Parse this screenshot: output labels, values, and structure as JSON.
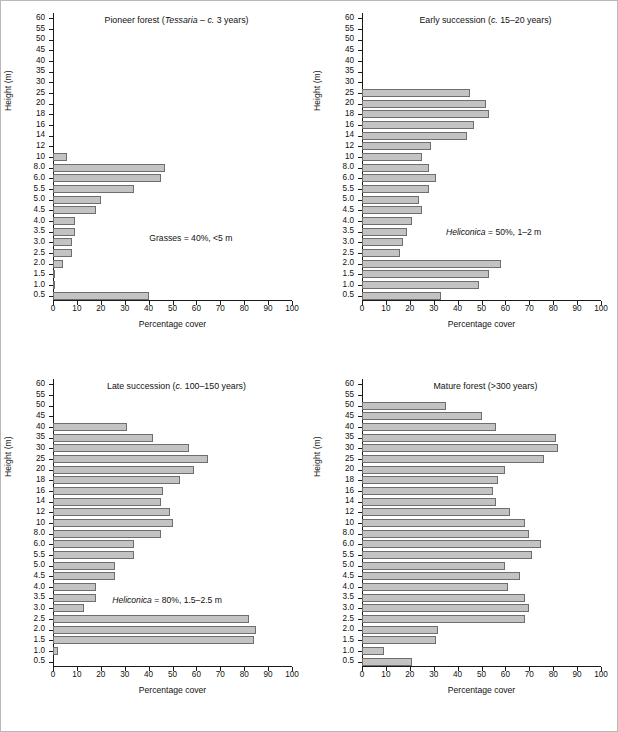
{
  "figure": {
    "name": "vegetation-profile-figure",
    "axis_x_title": "Percentage cover",
    "axis_y_title": "Height (m)",
    "bar_color": "#c3c3c3",
    "bar_edge_color": "#6e6e6e",
    "background": "#ffffff",
    "border_color": "#b9b9b9"
  },
  "axes": {
    "categories": [
      "60",
      "55",
      "50",
      "45",
      "40",
      "35",
      "30",
      "25",
      "20",
      "18",
      "16",
      "14",
      "12",
      "10",
      "8.0",
      "6.0",
      "5.5",
      "5.0",
      "4.5",
      "4.0",
      "3.5",
      "3.0",
      "2.5",
      "2.0",
      "1.5",
      "1.0",
      "0.5"
    ],
    "x_ticks": [
      0,
      10,
      20,
      30,
      40,
      50,
      60,
      70,
      80,
      90,
      100
    ],
    "x_tick_labels": [
      "0",
      "10",
      "20",
      "30",
      "40",
      "50",
      "60",
      "70",
      "80",
      "90",
      "100"
    ],
    "xlim": [
      0,
      100
    ]
  },
  "chart_data": [
    {
      "type": "bar",
      "orientation": "horizontal",
      "panel": "top-left",
      "title": "Pioneer forest (Tessaria – c. 3 years)",
      "title_parts": {
        "lead": "Pioneer forest (",
        "italic": "Tessaria",
        "mid": " – ",
        "italic2": "c.",
        "tail": " 3 years)"
      },
      "annotation": "Grasses = 40%, <5 m",
      "annotation_parts": {
        "italic": "",
        "text": "Grasses = 40%, <5 m"
      },
      "xlabel": "Percentage cover",
      "ylabel": "Height (m)",
      "xlim": [
        0,
        100
      ],
      "grid": false,
      "legend": "none",
      "categories": [
        "60",
        "55",
        "50",
        "45",
        "40",
        "35",
        "30",
        "25",
        "20",
        "18",
        "16",
        "14",
        "12",
        "10",
        "8.0",
        "6.0",
        "5.5",
        "5.0",
        "4.5",
        "4.0",
        "3.5",
        "3.0",
        "2.5",
        "2.0",
        "1.5",
        "1.0",
        "0.5"
      ],
      "values": [
        0,
        0,
        0,
        0,
        0,
        0,
        0,
        0,
        0,
        0,
        0,
        0,
        0,
        6,
        47,
        45,
        34,
        20,
        18,
        9,
        9,
        8,
        8,
        4,
        1,
        1,
        40
      ]
    },
    {
      "type": "bar",
      "orientation": "horizontal",
      "panel": "top-right",
      "title": "Early succession (c. 15–20 years)",
      "title_parts": {
        "lead": "Early succession (",
        "italic": "c.",
        "tail": " 15–20 years)"
      },
      "annotation": "Heliconica = 50%, 1–2 m",
      "annotation_parts": {
        "italic": "Heliconica",
        "text": " = 50%, 1–2 m"
      },
      "xlabel": "Percentage cover",
      "ylabel": "Height (m)",
      "xlim": [
        0,
        100
      ],
      "grid": false,
      "legend": "none",
      "categories": [
        "60",
        "55",
        "50",
        "45",
        "40",
        "35",
        "30",
        "25",
        "20",
        "18",
        "16",
        "14",
        "12",
        "10",
        "8.0",
        "6.0",
        "5.5",
        "5.0",
        "4.5",
        "4.0",
        "3.5",
        "3.0",
        "2.5",
        "2.0",
        "1.5",
        "1.0",
        "0.5"
      ],
      "values": [
        0,
        0,
        0,
        0,
        0,
        0,
        0,
        45,
        52,
        53,
        47,
        44,
        29,
        25,
        28,
        31,
        28,
        24,
        25,
        21,
        19,
        17,
        16,
        58,
        53,
        49,
        33
      ]
    },
    {
      "type": "bar",
      "orientation": "horizontal",
      "panel": "bottom-left",
      "title": "Late succession (c. 100–150 years)",
      "title_parts": {
        "lead": "Late succession (",
        "italic": "c.",
        "tail": " 100–150 years)"
      },
      "annotation": "Heliconica = 80%, 1.5–2.5 m",
      "annotation_parts": {
        "italic": "Heliconica",
        "text": " = 80%, 1.5–2.5 m"
      },
      "xlabel": "Percentage cover",
      "ylabel": "Height (m)",
      "xlim": [
        0,
        100
      ],
      "grid": false,
      "legend": "none",
      "categories": [
        "60",
        "55",
        "50",
        "45",
        "40",
        "35",
        "30",
        "25",
        "20",
        "18",
        "16",
        "14",
        "12",
        "10",
        "8.0",
        "6.0",
        "5.5",
        "5.0",
        "4.5",
        "4.0",
        "3.5",
        "3.0",
        "2.5",
        "2.0",
        "1.5",
        "1.0",
        "0.5"
      ],
      "values": [
        0,
        0,
        0,
        0,
        31,
        42,
        57,
        65,
        59,
        53,
        46,
        45,
        49,
        50,
        45,
        34,
        34,
        26,
        26,
        18,
        18,
        13,
        82,
        85,
        84,
        2,
        0
      ]
    },
    {
      "type": "bar",
      "orientation": "horizontal",
      "panel": "bottom-right",
      "title": "Mature forest (>300 years)",
      "title_parts": {
        "lead": "Mature forest (>300 years)",
        "italic": "",
        "tail": ""
      },
      "annotation": "",
      "annotation_parts": {
        "italic": "",
        "text": ""
      },
      "xlabel": "Percentage cover",
      "ylabel": "Height (m)",
      "xlim": [
        0,
        100
      ],
      "grid": false,
      "legend": "none",
      "categories": [
        "60",
        "55",
        "50",
        "45",
        "40",
        "35",
        "30",
        "25",
        "20",
        "18",
        "16",
        "14",
        "12",
        "10",
        "8.0",
        "6.0",
        "5.5",
        "5.0",
        "4.5",
        "4.0",
        "3.5",
        "3.0",
        "2.5",
        "2.0",
        "1.5",
        "1.0",
        "0.5"
      ],
      "values": [
        0,
        0,
        35,
        50,
        56,
        81,
        82,
        76,
        60,
        57,
        55,
        56,
        62,
        68,
        70,
        75,
        71,
        60,
        66,
        61,
        68,
        70,
        68,
        32,
        31,
        9,
        21
      ]
    }
  ]
}
